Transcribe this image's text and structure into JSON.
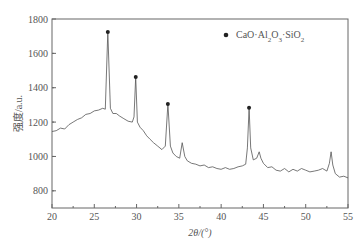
{
  "chart_data": {
    "type": "line",
    "title": "",
    "xlabel": "2θ/(°)",
    "ylabel": "强度/a.u.",
    "xlim": [
      20,
      55
    ],
    "ylim": [
      700,
      1800
    ],
    "xticks": [
      20,
      25,
      30,
      35,
      40,
      45,
      50,
      55
    ],
    "yticks": [
      800,
      1000,
      1200,
      1400,
      1600,
      1800
    ],
    "grid": false,
    "legend": {
      "position": "upper right",
      "entries": [
        {
          "marker": "filled-circle",
          "label": "CaO·Al2O3·SiO2"
        }
      ]
    },
    "series": [
      {
        "name": "XRD pattern",
        "color": "#555555",
        "x": [
          20.0,
          20.5,
          21.0,
          21.5,
          22.0,
          22.5,
          23.0,
          23.5,
          24.0,
          24.5,
          25.0,
          25.5,
          26.0,
          26.3,
          26.6,
          26.9,
          27.2,
          27.6,
          28.0,
          28.5,
          29.0,
          29.5,
          29.7,
          29.9,
          30.1,
          30.4,
          30.8,
          31.2,
          31.6,
          32.0,
          32.5,
          33.0,
          33.4,
          33.7,
          34.0,
          34.3,
          34.7,
          35.1,
          35.4,
          35.7,
          36.0,
          36.5,
          37.0,
          37.5,
          38.0,
          38.5,
          39.0,
          39.5,
          40.0,
          40.5,
          41.0,
          41.5,
          42.0,
          42.5,
          42.9,
          43.1,
          43.3,
          43.5,
          43.8,
          44.2,
          44.5,
          44.7,
          45.0,
          45.5,
          46.0,
          46.5,
          47.0,
          47.5,
          48.0,
          48.5,
          49.0,
          49.5,
          50.0,
          50.5,
          51.0,
          51.5,
          52.0,
          52.5,
          52.8,
          53.0,
          53.2,
          53.5,
          54.0,
          54.5,
          55.0
        ],
        "y": [
          1145,
          1150,
          1165,
          1160,
          1185,
          1200,
          1215,
          1225,
          1245,
          1250,
          1265,
          1270,
          1280,
          1275,
          1725,
          1280,
          1250,
          1250,
          1235,
          1220,
          1205,
          1200,
          1230,
          1463,
          1200,
          1170,
          1150,
          1120,
          1100,
          1080,
          1060,
          1040,
          1060,
          1306,
          1060,
          1020,
          1000,
          990,
          1080,
          1000,
          975,
          960,
          955,
          945,
          950,
          935,
          940,
          930,
          925,
          935,
          925,
          930,
          940,
          945,
          955,
          1050,
          1283,
          1050,
          980,
          990,
          1027,
          990,
          960,
          935,
          940,
          920,
          915,
          930,
          910,
          925,
          915,
          930,
          920,
          910,
          915,
          920,
          930,
          915,
          960,
          1027,
          950,
          900,
          880,
          885,
          875
        ]
      }
    ],
    "annotations": [
      {
        "x": 26.6,
        "y": 1725,
        "marker": "filled-circle",
        "phase": "CaO·Al2O3·SiO2"
      },
      {
        "x": 29.9,
        "y": 1463,
        "marker": "filled-circle",
        "phase": "CaO·Al2O3·SiO2"
      },
      {
        "x": 33.7,
        "y": 1306,
        "marker": "filled-circle",
        "phase": "CaO·Al2O3·SiO2"
      },
      {
        "x": 43.3,
        "y": 1283,
        "marker": "filled-circle",
        "phase": "CaO·Al2O3·SiO2"
      }
    ]
  },
  "legend": {
    "label_main": "CaO·Al",
    "sub1": "2",
    "mid1": "O",
    "sub2": "3",
    "mid2": "·SiO",
    "sub3": "2"
  },
  "axes": {
    "xlabel": "2θ/(°)",
    "ylabel": "强度/a.u."
  }
}
